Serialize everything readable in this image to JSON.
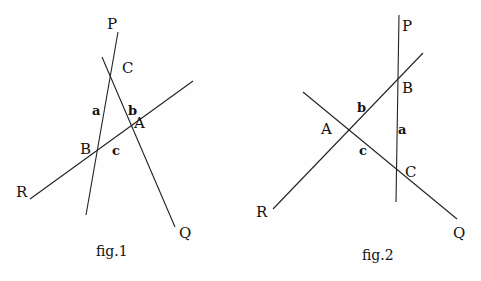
{
  "figures": [
    {
      "caption": "fig.1",
      "lines": [
        {
          "name": "line-p",
          "x1": 118,
          "y1": 32,
          "x2": 86,
          "y2": 215
        },
        {
          "name": "line-q",
          "x1": 102,
          "y1": 57,
          "x2": 175,
          "y2": 227
        },
        {
          "name": "line-r",
          "x1": 30,
          "y1": 199,
          "x2": 193,
          "y2": 81
        }
      ],
      "points": {
        "P": "P",
        "Q": "Q",
        "R": "R",
        "A": "A",
        "B": "B",
        "C": "C"
      },
      "sides": {
        "a": "a",
        "b": "b",
        "c": "c"
      }
    },
    {
      "caption": "fig.2",
      "lines": [
        {
          "name": "line-p",
          "x1": 399,
          "y1": 15,
          "x2": 396,
          "y2": 202
        },
        {
          "name": "line-q",
          "x1": 303,
          "y1": 92,
          "x2": 457,
          "y2": 219
        },
        {
          "name": "line-r",
          "x1": 273,
          "y1": 209,
          "x2": 423,
          "y2": 53
        }
      ],
      "points": {
        "P": "P",
        "Q": "Q",
        "R": "R",
        "A": "A",
        "B": "B",
        "C": "C"
      },
      "sides": {
        "a": "a",
        "b": "b",
        "c": "c"
      }
    }
  ]
}
